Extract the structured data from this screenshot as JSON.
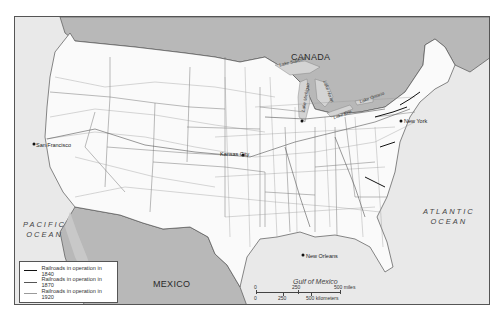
{
  "map": {
    "colors": {
      "us_land": "#fafafa",
      "foreign_land": "#b8b8b8",
      "water": "#e6e6e6",
      "border": "#555555",
      "rail_1840": "#111111",
      "rail_1870": "#555555",
      "rail_1920": "#9a9a9a"
    },
    "regions": {
      "canada": "CANADA",
      "mexico": "MEXICO"
    },
    "oceans": {
      "pacific_line1": "PACIFIC",
      "pacific_line2": "OCEAN",
      "atlantic_line1": "ATLANTIC",
      "atlantic_line2": "OCEAN",
      "gulf": "Gulf of Mexico"
    },
    "lakes": {
      "superior": "Lake Superior",
      "michigan": "Lake Michigan",
      "huron": "Lake Huron",
      "erie": "Lake Erie",
      "ontario": "Lake Ontario"
    },
    "cities": {
      "san_francisco": "San Francisco",
      "kansas_city": "Kansas City",
      "new_york": "New York",
      "new_orleans": "New Orleans"
    }
  },
  "legend": {
    "items": [
      {
        "label": "Railroads in operation in 1840",
        "style": "thick-black"
      },
      {
        "label": "Railroads in operation in 1870",
        "style": "medium-dark"
      },
      {
        "label": "Railroads in operation in 1920",
        "style": "thin-gray"
      }
    ]
  },
  "scale": {
    "miles": [
      "0",
      "250",
      "500 miles"
    ],
    "kilometers": [
      "0",
      "250",
      "500 kilometers"
    ]
  }
}
